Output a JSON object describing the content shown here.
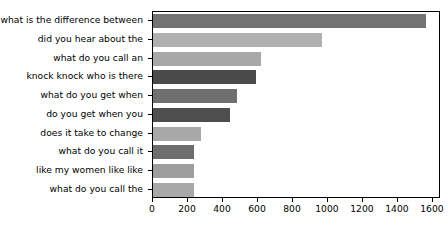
{
  "chart_data": {
    "type": "bar",
    "orientation": "horizontal",
    "title": "",
    "xlabel": "",
    "ylabel": "",
    "grid": false,
    "legend": null,
    "xlim": [
      0,
      1646
    ],
    "xticks": [
      0,
      200,
      400,
      600,
      800,
      1000,
      1200,
      1400,
      1600
    ],
    "categories": [
      "what is the difference between",
      "did you hear about the",
      "what do you call an",
      "knock knock who is there",
      "what do you get when",
      "do you get when you",
      "does it take to change",
      "what do you call it",
      "like my women like like",
      "what do you call the"
    ],
    "values": [
      1560,
      965,
      615,
      590,
      480,
      440,
      275,
      235,
      235,
      235
    ],
    "colors": [
      "#737373",
      "#b0b0b0",
      "#a8a8a8",
      "#4a4a4a",
      "#707070",
      "#4e4e4e",
      "#a8a8a8",
      "#6e6e6e",
      "#9e9e9e",
      "#a8a8a8"
    ]
  }
}
